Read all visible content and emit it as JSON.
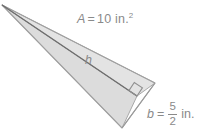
{
  "figure": {
    "kind": "geometry-diagram",
    "shape": "triangle",
    "background_color": "#ffffff",
    "fill_color": "#dddddd",
    "upper_fill_color": "#e4e4e4",
    "stroke_color": "#a8a8a8",
    "height_line_color": "#6e6e6e",
    "text_color": "#8a8a8a"
  },
  "labels": {
    "area": {
      "variable": "A",
      "equals": "=",
      "value": "10",
      "unit": "in.",
      "exponent": "2"
    },
    "height": {
      "variable": "h"
    },
    "base": {
      "variable": "b",
      "equals": "=",
      "numerator": "5",
      "denominator": "2",
      "unit": "in."
    }
  },
  "geometry": {
    "apex": [
      2,
      5
    ],
    "right_vertex": [
      155,
      83
    ],
    "bottom_vertex": [
      122,
      128
    ],
    "height_foot": [
      137,
      96
    ],
    "right_angle_marker": true
  }
}
